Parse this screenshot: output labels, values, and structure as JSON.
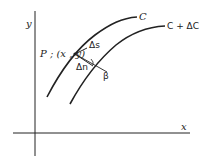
{
  "diagram": {
    "axes": {
      "x_label": "x",
      "y_label": "y"
    },
    "curves": [
      {
        "name": "curve-c",
        "label": "C"
      },
      {
        "name": "curve-c-plus-delta-c",
        "label": "C + ΔC"
      }
    ],
    "point": {
      "label": "P ; (x , y)"
    },
    "annotations": {
      "delta_s": "Δs",
      "delta_n": "Δn",
      "beta": "β"
    },
    "colors": {
      "stroke": "#222222",
      "background": "#ffffff"
    }
  }
}
